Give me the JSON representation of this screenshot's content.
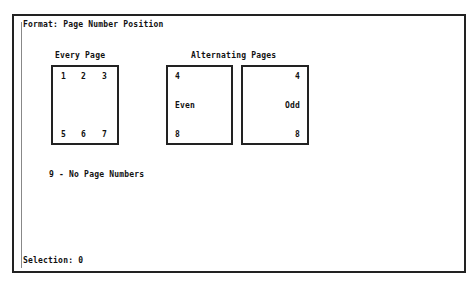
{
  "screen": {
    "title": "Format: Page Number Position",
    "every_page": {
      "heading": "Every Page",
      "top": [
        "1",
        "2",
        "3"
      ],
      "bottom": [
        "5",
        "6",
        "7"
      ]
    },
    "alternating": {
      "heading": "Alternating Pages",
      "even": {
        "top": "4",
        "middle": "Even",
        "bottom": "8"
      },
      "odd": {
        "top": "4",
        "middle": "Odd",
        "bottom": "8"
      }
    },
    "no_numbers_option": "9 - No Page Numbers",
    "prompt": "Selection: 0"
  }
}
